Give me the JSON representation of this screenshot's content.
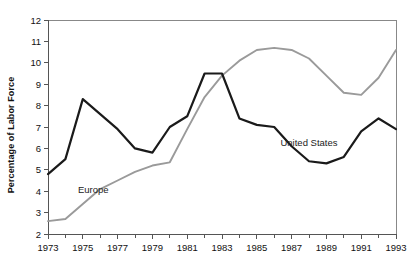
{
  "chart_data": {
    "type": "line",
    "title": "",
    "xlabel": "",
    "ylabel": "Percentage of Labor Force",
    "xlim": [
      1973,
      1993
    ],
    "ylim": [
      2,
      12
    ],
    "ytick_labels": [
      "2",
      "3",
      "4",
      "5",
      "6",
      "7",
      "8",
      "9",
      "10",
      "11",
      "12"
    ],
    "ytick_values": [
      2,
      3,
      4,
      5,
      6,
      7,
      8,
      9,
      10,
      11,
      12
    ],
    "xtick_labels": [
      "1973",
      "1975",
      "1977",
      "1979",
      "1981",
      "1983",
      "1985",
      "1987",
      "1989",
      "1991",
      "1993"
    ],
    "xtick_values": [
      1973,
      1975,
      1977,
      1979,
      1981,
      1983,
      1985,
      1987,
      1989,
      1991,
      1993
    ],
    "minor_xticks": [
      1974,
      1976,
      1978,
      1980,
      1982,
      1984,
      1986,
      1988,
      1990,
      1992
    ],
    "grid": false,
    "legend_position": "inline-annotation",
    "x": [
      1973,
      1974,
      1975,
      1976,
      1977,
      1978,
      1979,
      1980,
      1981,
      1982,
      1983,
      1984,
      1985,
      1986,
      1987,
      1988,
      1989,
      1990,
      1991,
      1992,
      1993
    ],
    "series": [
      {
        "name": "United States",
        "color": "#1a1a1a",
        "label_x": 1988,
        "label_y": 6.1,
        "values": [
          4.8,
          5.5,
          8.3,
          7.6,
          6.9,
          6.0,
          5.8,
          7.0,
          7.5,
          9.5,
          9.5,
          7.4,
          7.1,
          7.0,
          6.1,
          5.4,
          5.3,
          5.6,
          6.8,
          7.4,
          6.9
        ]
      },
      {
        "name": "Europe",
        "color": "#9a9a9a",
        "label_x": 1975.6,
        "label_y": 3.9,
        "values": [
          2.6,
          2.7,
          3.4,
          4.1,
          4.5,
          4.9,
          5.2,
          5.35,
          6.9,
          8.4,
          9.4,
          10.1,
          10.6,
          10.7,
          10.6,
          10.2,
          9.4,
          8.6,
          8.5,
          9.3,
          10.6
        ]
      }
    ]
  }
}
